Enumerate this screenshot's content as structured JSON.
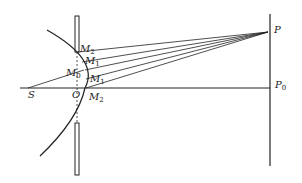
{
  "diagram": {
    "type": "optics-ray-diagram",
    "colors": {
      "line": "#222222",
      "background": "#ffffff"
    },
    "labels": {
      "S": "S",
      "O": "O",
      "P": "P",
      "P0_main": "P",
      "P0_sub": "0",
      "M2_top_main": "M",
      "M2_top_sub": "2",
      "M1_top_main": "M",
      "M1_top_sub": "1",
      "M0_main": "M",
      "M0_sub": "0",
      "M1_bottom_main": "M",
      "M1_bottom_sub": "1",
      "M2_bottom_main": "M",
      "M2_bottom_sub": "2"
    }
  }
}
